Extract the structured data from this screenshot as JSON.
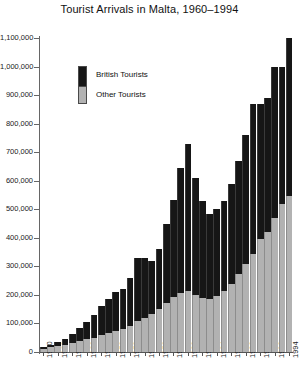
{
  "chart_data": {
    "type": "bar",
    "subtype": "stacked",
    "title": "Tourist Arrivals in Malta, 1960–1994",
    "xlabel": "",
    "ylabel": "",
    "ylim": [
      0,
      1100000
    ],
    "ytick_step": 100000,
    "grid": false,
    "legend_position": "upper-left-inside",
    "categories": [
      "1960",
      "1961",
      "1962",
      "1963",
      "1964",
      "1965",
      "1966",
      "1967",
      "1968",
      "1969",
      "1970",
      "1971",
      "1972",
      "1973",
      "1974",
      "1975",
      "1976",
      "1977",
      "1978",
      "1979",
      "1980",
      "1981",
      "1982",
      "1983",
      "1984",
      "1985",
      "1986",
      "1987",
      "1988",
      "1989",
      "1990",
      "1991",
      "1992",
      "1993",
      "1994"
    ],
    "ytick_labels": [
      "0",
      "100,000",
      "200,000",
      "300,000",
      "400,000",
      "500,000",
      "600,000",
      "700,000",
      "800,000",
      "900,000",
      "1,000,000",
      "1,100,000"
    ],
    "ytick_values": [
      0,
      100000,
      200000,
      300000,
      400000,
      500000,
      600000,
      700000,
      800000,
      900000,
      1000000,
      1100000
    ],
    "xtick_labels": [
      "1960",
      "1962",
      "1964",
      "1966",
      "1968",
      "1970",
      "1972",
      "1974",
      "1976",
      "1978",
      "1980",
      "1982",
      "1984",
      "1986",
      "1988",
      "1990",
      "1992",
      "1994"
    ],
    "series": [
      {
        "name": "Other Tourists",
        "color": "#b2b2b2",
        "values": [
          12000,
          16000,
          20000,
          26000,
          32000,
          38000,
          44000,
          50000,
          58000,
          66000,
          72000,
          80000,
          92000,
          108000,
          120000,
          132000,
          150000,
          170000,
          192000,
          205000,
          215000,
          200000,
          190000,
          185000,
          196000,
          215000,
          240000,
          275000,
          310000,
          345000,
          395000,
          420000,
          470000,
          520000,
          545000
        ]
      },
      {
        "name": "British Tourists",
        "color": "#161616",
        "values": [
          7000,
          10000,
          14000,
          20000,
          30000,
          45000,
          62000,
          78000,
          102000,
          120000,
          138000,
          140000,
          168000,
          222000,
          210000,
          188000,
          210000,
          280000,
          340000,
          440000,
          515000,
          410000,
          340000,
          300000,
          304000,
          315000,
          350000,
          395000,
          450000,
          525000,
          475000,
          470000,
          530000,
          480000,
          555000
        ]
      }
    ],
    "totals": [
      19000,
      26000,
      34000,
      46000,
      62000,
      83000,
      106000,
      128000,
      160000,
      186000,
      210000,
      220000,
      260000,
      330000,
      330000,
      320000,
      360000,
      450000,
      532000,
      645000,
      730000,
      610000,
      530000,
      485000,
      500000,
      530000,
      590000,
      670000,
      760000,
      870000,
      870000,
      890000,
      1000000,
      1000000,
      1100000
    ]
  },
  "legend": {
    "british_label": "British Tourists",
    "other_label": "Other Tourists"
  }
}
